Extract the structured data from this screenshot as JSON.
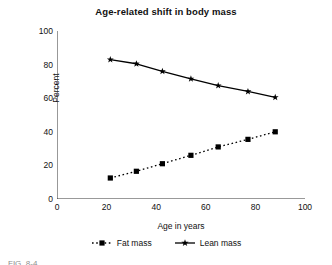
{
  "figure": {
    "title": "Age-related shift in body mass",
    "caption_partial": "FIG. 8-4"
  },
  "chart_data": {
    "type": "line",
    "title": "Age-related shift in body mass",
    "xlabel": "Age in years",
    "ylabel": "Percent",
    "xlim": [
      0,
      100
    ],
    "ylim": [
      0,
      100
    ],
    "xticks": [
      0,
      20,
      40,
      60,
      80,
      100
    ],
    "yticks": [
      0,
      20,
      40,
      60,
      80,
      100
    ],
    "xtick_labels": [
      "0",
      "20",
      "40",
      "60",
      "80",
      "100"
    ],
    "ytick_labels": [
      "0",
      "20",
      "40",
      "60",
      "80",
      "100"
    ],
    "grid": false,
    "legend_position": "bottom",
    "x": [
      21.5,
      32,
      42.5,
      54,
      65,
      77,
      88
    ],
    "series": [
      {
        "name": "Fat mass",
        "marker": "square",
        "linestyle": "dotted",
        "color": "#000000",
        "values": [
          12.5,
          16.5,
          21,
          26,
          31,
          35.5,
          40
        ]
      },
      {
        "name": "Lean mass",
        "marker": "star",
        "linestyle": "solid",
        "color": "#000000",
        "values": [
          83,
          80.5,
          76,
          71.5,
          67.5,
          64,
          60.5
        ]
      }
    ]
  },
  "legend": {
    "items": [
      {
        "label": "Fat mass",
        "marker": "square-marker-icon",
        "linestyle": "dotted"
      },
      {
        "label": "Lean mass",
        "marker": "star-marker-icon",
        "linestyle": "solid"
      }
    ]
  },
  "colors": {
    "ink": "#000000",
    "axis": "#333333",
    "background": "#ffffff"
  }
}
